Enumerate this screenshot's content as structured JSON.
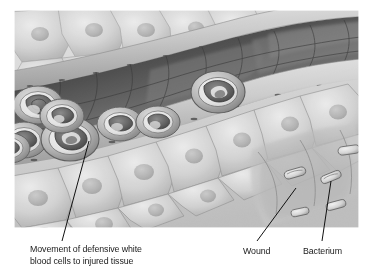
{
  "figure": {
    "style": "grayscale scientific illustration",
    "image_area": {
      "x": 14,
      "y": 10,
      "width": 345,
      "height": 218
    },
    "background_color": "#ffffff"
  },
  "labels": {
    "white_blood_cells": {
      "line1": "Movement of defensive white",
      "line2": "blood cells to injured tissue",
      "text": "Movement of defensive white blood cells to injured tissue"
    },
    "wound": {
      "text": "Wound"
    },
    "bacterium": {
      "text": "Bacterium"
    }
  },
  "leader_lines": [
    {
      "name": "leader-white-blood-cells",
      "from": [
        89,
        141
      ],
      "to": [
        62,
        241
      ]
    },
    {
      "name": "leader-wound",
      "from": [
        296,
        188
      ],
      "to": [
        257,
        241
      ]
    },
    {
      "name": "leader-bacterium",
      "from": [
        331,
        181
      ],
      "to": [
        322,
        241
      ]
    }
  ],
  "colors": {
    "text": "#1a1a1a",
    "leader_line": "#111111",
    "vessel_lumen_dark": "#3a3a3a",
    "tissue_light": "#d8d8d8",
    "cell_outline": "#6a6a6a",
    "nucleus": "#8c8c8c",
    "highlight": "#f2f2f2"
  },
  "structures": {
    "blood_vessel": "diagonal vessel with dark lumen and cellular wall",
    "white_blood_cells_count": 7,
    "epithelial_cells": "polygonal tissue cells with oval nuclei",
    "bacteria_count": 5,
    "wound_region": "lower right depressed tissue area"
  }
}
